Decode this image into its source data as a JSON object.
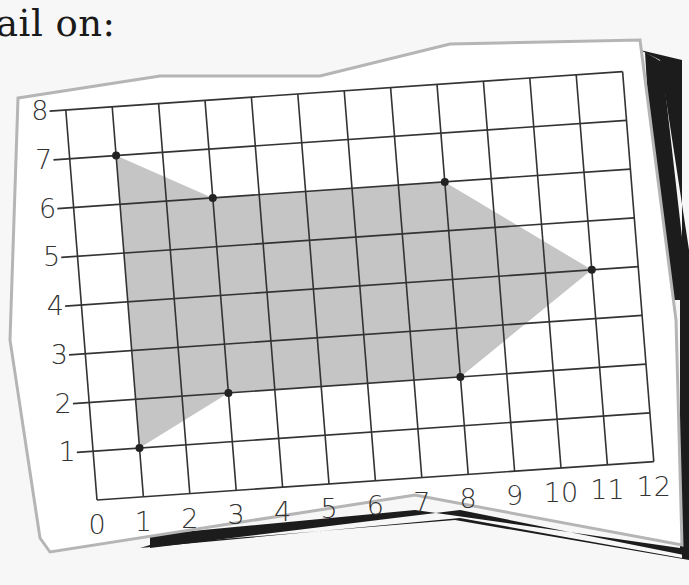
{
  "caption": "ail on:",
  "colors": {
    "background": "#f7f7f7",
    "paper": "#ffffff",
    "paper_border": "#b5b5b5",
    "shadow": "#1c1c1c",
    "grid_line": "#333333",
    "shape_fill": "#c2c2c2",
    "vertex_dot": "#222222"
  },
  "chart_data": {
    "type": "coordinate-grid",
    "title": "",
    "xlabel": "",
    "ylabel": "",
    "x_ticks": [
      "0",
      "1",
      "2",
      "3",
      "4",
      "5",
      "6",
      "7",
      "8",
      "9",
      "10",
      "11",
      "12"
    ],
    "y_ticks": [
      "1",
      "2",
      "3",
      "4",
      "5",
      "6",
      "7",
      "8"
    ],
    "xlim": [
      0,
      12
    ],
    "ylim": [
      0,
      8
    ],
    "grid": true,
    "shape": {
      "name": "shaded arrow polygon",
      "vertices": [
        [
          1,
          7
        ],
        [
          3,
          6
        ],
        [
          8,
          6
        ],
        [
          11,
          4
        ],
        [
          8,
          2
        ],
        [
          3,
          2
        ],
        [
          1,
          1
        ]
      ]
    }
  }
}
